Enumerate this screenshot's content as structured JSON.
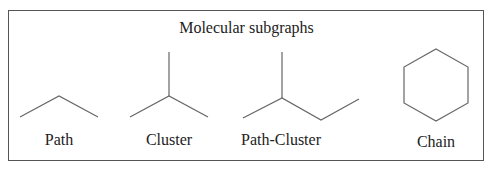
{
  "title": "Molecular subgraphs",
  "subgraphs": [
    {
      "name": "Path",
      "label": "Path"
    },
    {
      "name": "Cluster",
      "label": "Cluster"
    },
    {
      "name": "Path-Cluster",
      "label": "Path-Cluster"
    },
    {
      "name": "Chain",
      "label": "Chain"
    }
  ],
  "colors": {
    "line": "#666666",
    "text": "#222222",
    "border": "#555555"
  }
}
